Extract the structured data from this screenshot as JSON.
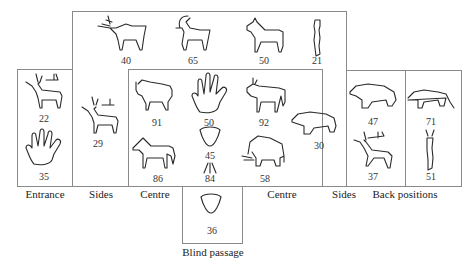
{
  "diagram": {
    "type": "cave-layout-of-figure-types",
    "zones": {
      "entrance": {
        "label": "Entrance",
        "figures": [
          {
            "kind": "stag",
            "count": "22"
          },
          {
            "kind": "hand",
            "count": "35"
          }
        ]
      },
      "sides_left": {
        "label": "Sides",
        "figures": [
          {
            "kind": "stag",
            "count": "29"
          }
        ]
      },
      "sides_top": {
        "figures": [
          {
            "kind": "stag",
            "count": "40"
          },
          {
            "kind": "ibex",
            "count": "65"
          },
          {
            "kind": "horse",
            "count": "50"
          },
          {
            "kind": "anthropomorph",
            "count": "21"
          }
        ]
      },
      "centre": {
        "label_left": "Centre",
        "label_right": "Centre",
        "figures": [
          {
            "kind": "bison",
            "count": "91"
          },
          {
            "kind": "hand",
            "count": "50"
          },
          {
            "kind": "aurochs",
            "count": "92"
          },
          {
            "kind": "horse",
            "count": "86"
          },
          {
            "kind": "triangle-sign",
            "count": "45"
          },
          {
            "kind": "line-sign",
            "count": "84"
          },
          {
            "kind": "mammoth",
            "count": "58"
          }
        ]
      },
      "sides_right": {
        "label": "Sides",
        "figures": [
          {
            "kind": "bear",
            "count": "30"
          }
        ]
      },
      "back_positions": {
        "label": "Back positions",
        "figures": [
          {
            "kind": "bear",
            "count": "47"
          },
          {
            "kind": "feline",
            "count": "71"
          },
          {
            "kind": "stag",
            "count": "37"
          },
          {
            "kind": "anthropomorph",
            "count": "51"
          }
        ]
      },
      "blind_passage": {
        "label": "Blind passage",
        "figures": [
          {
            "kind": "triangle-sign",
            "count": "36"
          }
        ]
      }
    }
  }
}
